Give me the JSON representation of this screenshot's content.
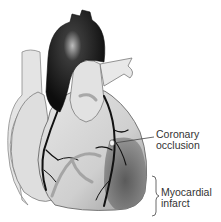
{
  "diagram": {
    "labels": {
      "coronary_occlusion": {
        "line1": "Coronary",
        "line2": "occlusion"
      },
      "myocardial_infarct": {
        "line1": "Myocardial",
        "line2": "infarct"
      }
    },
    "colors": {
      "background": "#ffffff",
      "aorta": "#1a1a1a",
      "heart_light": "#dcdcdc",
      "infarct_region": "#6e6e6e",
      "vessels": "#111111",
      "label_text": "#333333"
    }
  }
}
